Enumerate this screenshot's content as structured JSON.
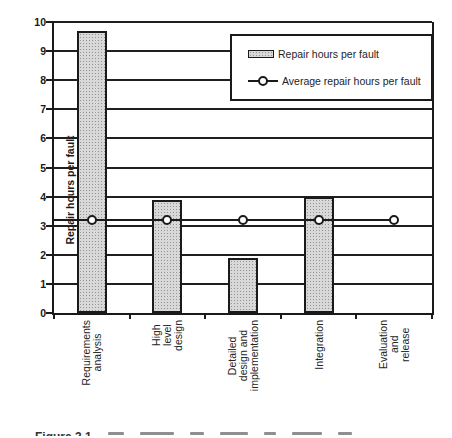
{
  "figure": {
    "background": "#ffffff",
    "caption": {
      "visible_text": "Figure 3.1"
    }
  },
  "chart_data": {
    "type": "bar",
    "title": "",
    "xlabel": "",
    "ylabel": "Repair hours per fault",
    "ylim": [
      0,
      10
    ],
    "ytick_step": 1,
    "grid": true,
    "legend_position": "top-right",
    "categories": [
      "Requirements\nanalysis",
      "High level design",
      "Detailed design and\nimplementation",
      "Integration",
      "Evaluation and\nrelease"
    ],
    "series": [
      {
        "name": "Repair hours per fault",
        "type": "bar",
        "values": [
          9.7,
          3.9,
          1.9,
          4.0,
          0
        ]
      },
      {
        "name": "Average repair hours per fault",
        "type": "line",
        "values": [
          3.2,
          3.2,
          3.2,
          3.2,
          3.2
        ]
      }
    ],
    "colors": {
      "bar_fill": "#d8d8d8",
      "bar_dot": "#949494",
      "bar_border": "#1a1a1a",
      "line": "#1a1a1a",
      "marker_fill": "#ffffff",
      "grid": "#1f1f1f",
      "background": "#ffffff"
    }
  }
}
